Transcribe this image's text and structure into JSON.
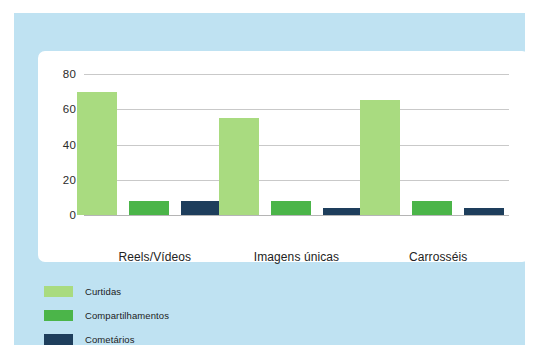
{
  "chart_data": {
    "type": "bar",
    "title": "",
    "subtitle": "",
    "xlabel": "",
    "ylabel": "",
    "categories": [
      "Reels/Vídeos",
      "Imagens únicas",
      "Carrosséis"
    ],
    "series": [
      {
        "name": "Curtidas",
        "values": [
          70,
          55,
          65
        ],
        "color": "#a9db80"
      },
      {
        "name": "Compartilhamentos",
        "values": [
          8,
          8,
          8
        ],
        "color": "#4bb549"
      },
      {
        "name": "Cometários",
        "values": [
          8,
          4,
          4
        ],
        "color": "#1e3e5c"
      }
    ],
    "ylim": [
      0,
      80
    ],
    "yticks": [
      0,
      20,
      40,
      60,
      80
    ],
    "ytick_labels": [
      "0",
      "20",
      "40",
      "60",
      "80"
    ],
    "grid": true,
    "legend_position": "below-left",
    "annotations": []
  },
  "legend": {
    "items": [
      {
        "label": "Curtidas",
        "swatch": "curtidas-swatch"
      },
      {
        "label": "Compartilhamentos",
        "swatch": "compartilhamentos-swatch"
      },
      {
        "label": "Cometários",
        "swatch": "cometarios-swatch"
      }
    ]
  },
  "colors": {
    "outer_background": "#ffffff",
    "panel_background": "#bfe2f2",
    "card_background": "#ffffff",
    "gridline": "#c9c9c9",
    "axis_text": "#232323",
    "curtidas": "#a9db80",
    "compartilhamentos": "#4bb549",
    "cometarios": "#1e3e5c"
  }
}
